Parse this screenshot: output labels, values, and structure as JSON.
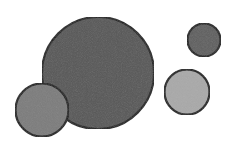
{
  "diagram": {
    "width": 245,
    "height": 147,
    "background": "#ffffff",
    "stroke_color": "#1e1e1e",
    "circles": [
      {
        "id": "large-circle",
        "cx": 98,
        "cy": 73,
        "r": 56,
        "fill": "#575757",
        "stroke_width": 2.2
      },
      {
        "id": "small-left-circle",
        "cx": 42,
        "cy": 110,
        "r": 26.5,
        "fill": "#7c7c7c",
        "stroke_width": 2.2
      },
      {
        "id": "top-right-circle",
        "cx": 204,
        "cy": 40,
        "r": 16.5,
        "fill": "#5f5f5f",
        "stroke_width": 2.2
      },
      {
        "id": "light-right-circle",
        "cx": 187,
        "cy": 92,
        "r": 22.5,
        "fill": "#a9a9a9",
        "stroke_width": 2.2
      }
    ]
  }
}
